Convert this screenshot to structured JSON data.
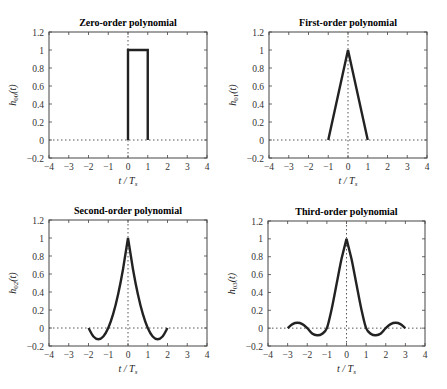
{
  "figure": {
    "panels": [
      {
        "title": "Zero-order polynomial",
        "ylabel_base": "h",
        "ylabel_sub": "00",
        "ylabel_tail": "(t)",
        "xlabel": "t / T",
        "xlabel_sub": "s"
      },
      {
        "title": "First-order polynomial",
        "ylabel_base": "h",
        "ylabel_sub": "01",
        "ylabel_tail": "(t)",
        "xlabel": "t / T",
        "xlabel_sub": "s"
      },
      {
        "title": "Second-order polynomial",
        "ylabel_base": "h",
        "ylabel_sub": "02",
        "ylabel_tail": "(t)",
        "xlabel": "t / T",
        "xlabel_sub": "s"
      },
      {
        "title": "Third-order polynomial",
        "ylabel_base": "h",
        "ylabel_sub": "03",
        "ylabel_tail": "(t)",
        "xlabel": "t / T",
        "xlabel_sub": "s"
      }
    ],
    "xticks": [
      "−4",
      "−3",
      "−2",
      "−1",
      "0",
      "1",
      "2",
      "3",
      "4"
    ],
    "yticks": [
      "−0.2",
      "0",
      "0.2",
      "0.4",
      "0.6",
      "0.8",
      "1",
      "1.2"
    ],
    "line_color": "#222222"
  },
  "chart_data": [
    {
      "type": "line",
      "title": "Zero-order polynomial",
      "xlabel": "t / T_s",
      "ylabel": "h_00(t)",
      "xlim": [
        -4,
        4
      ],
      "ylim": [
        -0.2,
        1.2
      ],
      "grid": false,
      "reference_lines": {
        "y": 0,
        "x": 0,
        "style": "dotted"
      },
      "x": [
        0,
        0,
        1,
        1
      ],
      "y": [
        0,
        1,
        1,
        0
      ]
    },
    {
      "type": "line",
      "title": "First-order polynomial",
      "xlabel": "t / T_s",
      "ylabel": "h_01(t)",
      "xlim": [
        -4,
        4
      ],
      "ylim": [
        -0.2,
        1.2
      ],
      "grid": false,
      "reference_lines": {
        "y": 0,
        "x": 0,
        "style": "dotted"
      },
      "x": [
        -1,
        0,
        1
      ],
      "y": [
        0,
        1,
        0
      ]
    },
    {
      "type": "line",
      "title": "Second-order polynomial",
      "xlabel": "t / T_s",
      "ylabel": "h_02(t)",
      "xlim": [
        -4,
        4
      ],
      "ylim": [
        -0.2,
        1.2
      ],
      "grid": false,
      "reference_lines": {
        "y": 0,
        "x": 0,
        "style": "dotted"
      },
      "x": [
        -2,
        -1.75,
        -1.5,
        -1.25,
        -1,
        -0.75,
        -0.5,
        -0.25,
        0,
        0.25,
        0.5,
        0.75,
        1,
        1.25,
        1.5,
        1.75,
        2
      ],
      "y": [
        0,
        -0.094,
        -0.125,
        -0.094,
        0,
        0.156,
        0.375,
        0.656,
        1,
        0.656,
        0.375,
        0.156,
        0,
        -0.094,
        -0.125,
        -0.094,
        0
      ]
    },
    {
      "type": "line",
      "title": "Third-order polynomial",
      "xlabel": "t / T_s",
      "ylabel": "h_03(t)",
      "xlim": [
        -4,
        4
      ],
      "ylim": [
        -0.2,
        1.2
      ],
      "grid": false,
      "reference_lines": {
        "y": 0,
        "x": 0,
        "style": "dotted"
      },
      "x": [
        -3,
        -2.75,
        -2.5,
        -2.25,
        -2,
        -1.75,
        -1.5,
        -1.25,
        -1,
        -0.75,
        -0.5,
        -0.25,
        0,
        0.25,
        0.5,
        0.75,
        1,
        1.25,
        1.5,
        1.75,
        2,
        2.25,
        2.5,
        2.75,
        3
      ],
      "y": [
        0,
        0.045,
        0.06,
        0.045,
        0,
        -0.06,
        -0.08,
        -0.065,
        0,
        0.22,
        0.5,
        0.78,
        1,
        0.78,
        0.5,
        0.22,
        0,
        -0.065,
        -0.08,
        -0.06,
        0,
        0.045,
        0.06,
        0.045,
        0
      ]
    }
  ]
}
